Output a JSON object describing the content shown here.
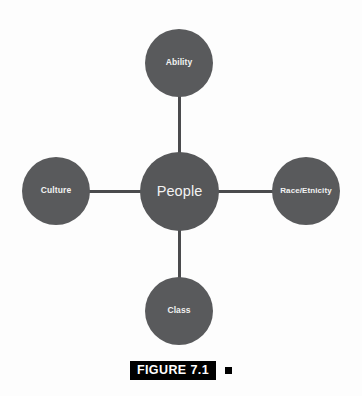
{
  "figure": {
    "caption_label": "FIGURE 7.1",
    "caption_marker": "",
    "background_color": "#fdfdfd",
    "node_color": "#595a5c",
    "node_text_color": "#f2f2f2",
    "connector_color": "#4a4b4d",
    "caption_bar_color": "#000000",
    "caption_text_color": "#ffffff"
  },
  "diagram": {
    "type": "concept-map",
    "layout": "radial-hub-and-spoke",
    "center": {
      "label": "People",
      "position": "center"
    },
    "satellites": [
      {
        "label": "Ability",
        "position": "top"
      },
      {
        "label": "Race/Etnicity",
        "position": "right"
      },
      {
        "label": "Class",
        "position": "bottom"
      },
      {
        "label": "Culture",
        "position": "left"
      }
    ],
    "connections": [
      {
        "from": "People",
        "to": "Ability"
      },
      {
        "from": "People",
        "to": "Race/Etnicity"
      },
      {
        "from": "People",
        "to": "Class"
      },
      {
        "from": "People",
        "to": "Culture"
      }
    ]
  }
}
